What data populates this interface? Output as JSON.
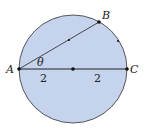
{
  "diagram": {
    "colors": {
      "fill": "#c5d3ec",
      "stroke": "#333333",
      "point": "#111111"
    },
    "circle": {
      "cx": 73,
      "cy": 69,
      "r": 54
    },
    "points": {
      "A": {
        "label": "A",
        "x": 19,
        "y": 69
      },
      "B": {
        "label": "B",
        "x": 99,
        "y": 22
      },
      "C": {
        "label": "C",
        "x": 127,
        "y": 69
      },
      "center": {
        "x": 73,
        "y": 69
      },
      "midAB": {
        "x": 69,
        "y": 40
      },
      "arcDot": {
        "x": 118,
        "y": 41
      }
    },
    "angle_label": "θ",
    "segment_labels": [
      "2",
      "2"
    ]
  }
}
